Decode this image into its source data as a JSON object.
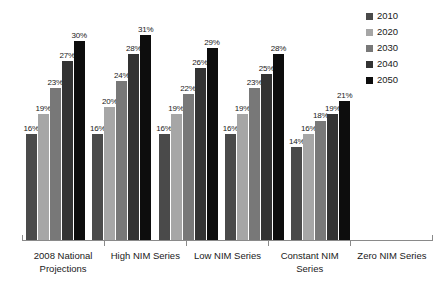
{
  "chart_data": {
    "type": "bar",
    "title": "",
    "subtitle": "",
    "xlabel": "",
    "ylabel": "",
    "ylim": [
      0,
      35
    ],
    "grid": false,
    "legend_position": "right",
    "value_suffix": "%",
    "categories": [
      "2008 National Projections",
      "High NIM Series",
      "Low NIM Series",
      "Constant NIM Series",
      "Zero NIM Series"
    ],
    "series": [
      {
        "name": "2010",
        "color": "#4a4a4a",
        "values": [
          16,
          16,
          16,
          16,
          14
        ]
      },
      {
        "name": "2020",
        "color": "#a6a6a6",
        "values": [
          19,
          20,
          19,
          19,
          16
        ]
      },
      {
        "name": "2030",
        "color": "#787878",
        "values": [
          23,
          24,
          22,
          23,
          18
        ]
      },
      {
        "name": "2040",
        "color": "#333333",
        "values": [
          27,
          28,
          26,
          25,
          19
        ]
      },
      {
        "name": "2050",
        "color": "#0d0d0d",
        "values": [
          30,
          31,
          29,
          28,
          21
        ]
      }
    ],
    "data_labels": [
      [
        "16%",
        "19%",
        "23%",
        "27%",
        "30%"
      ],
      [
        "16%",
        "20%",
        "24%",
        "28%",
        "31%"
      ],
      [
        "16%",
        "19%",
        "22%",
        "26%",
        "29%"
      ],
      [
        "16%",
        "19%",
        "23%",
        "25%",
        "28%"
      ],
      [
        "14%",
        "16%",
        "18%",
        "19%",
        "21%"
      ]
    ],
    "axis_color": "#8a8a8a"
  },
  "legend": {
    "items": [
      {
        "label": "2010",
        "color": "#4a4a4a"
      },
      {
        "label": "2020",
        "color": "#a6a6a6"
      },
      {
        "label": "2030",
        "color": "#787878"
      },
      {
        "label": "2040",
        "color": "#333333"
      },
      {
        "label": "2050",
        "color": "#0d0d0d"
      }
    ]
  }
}
